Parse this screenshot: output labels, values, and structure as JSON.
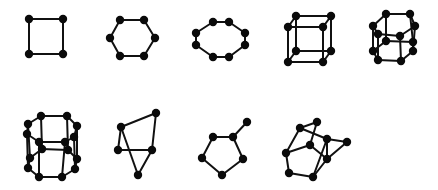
{
  "figure": {
    "width": 438,
    "height": 190,
    "background": "#ffffff",
    "ink_color": "#0a0a0a",
    "node_radius": 4.2,
    "edge_width": 2
  },
  "graphs": [
    {
      "id": "square",
      "nodes": [
        [
          29,
          19
        ],
        [
          63,
          19
        ],
        [
          63,
          54
        ],
        [
          29,
          54
        ]
      ],
      "edges": [
        [
          0,
          1
        ],
        [
          1,
          2
        ],
        [
          2,
          3
        ],
        [
          3,
          0
        ]
      ]
    },
    {
      "id": "hexagon",
      "nodes": [
        [
          120,
          20
        ],
        [
          144,
          20
        ],
        [
          155,
          38
        ],
        [
          144,
          56
        ],
        [
          120,
          56
        ],
        [
          110,
          38
        ]
      ],
      "edges": [
        [
          0,
          1
        ],
        [
          1,
          2
        ],
        [
          2,
          3
        ],
        [
          3,
          4
        ],
        [
          4,
          5
        ],
        [
          5,
          0
        ]
      ]
    },
    {
      "id": "octagon",
      "nodes": [
        [
          213,
          22
        ],
        [
          229,
          22
        ],
        [
          245,
          33
        ],
        [
          245,
          45
        ],
        [
          229,
          57
        ],
        [
          213,
          57
        ],
        [
          196,
          45
        ],
        [
          196,
          33
        ]
      ],
      "edges": [
        [
          0,
          1
        ],
        [
          1,
          2
        ],
        [
          2,
          3
        ],
        [
          3,
          4
        ],
        [
          4,
          5
        ],
        [
          5,
          6
        ],
        [
          6,
          7
        ],
        [
          7,
          0
        ]
      ]
    },
    {
      "id": "cube",
      "nodes": [
        [
          296,
          16
        ],
        [
          331,
          16
        ],
        [
          331,
          51
        ],
        [
          296,
          51
        ],
        [
          288,
          27
        ],
        [
          323,
          27
        ],
        [
          323,
          62
        ],
        [
          288,
          62
        ]
      ],
      "edges": [
        [
          0,
          1
        ],
        [
          1,
          2
        ],
        [
          2,
          3
        ],
        [
          3,
          0
        ],
        [
          4,
          5
        ],
        [
          5,
          6
        ],
        [
          6,
          7
        ],
        [
          7,
          4
        ],
        [
          0,
          4
        ],
        [
          1,
          5
        ],
        [
          2,
          6
        ],
        [
          3,
          7
        ]
      ]
    },
    {
      "id": "hexagonal-prism",
      "nodes": [
        [
          386,
          14
        ],
        [
          410,
          14
        ],
        [
          415,
          26
        ],
        [
          373,
          26
        ],
        [
          378,
          34
        ],
        [
          400,
          36
        ],
        [
          386,
          41
        ],
        [
          413,
          42
        ],
        [
          373,
          51
        ],
        [
          413,
          51
        ],
        [
          378,
          60
        ],
        [
          401,
          61
        ]
      ],
      "edges": [
        [
          0,
          1
        ],
        [
          1,
          2
        ],
        [
          2,
          5
        ],
        [
          5,
          4
        ],
        [
          4,
          3
        ],
        [
          3,
          0
        ],
        [
          6,
          7
        ],
        [
          7,
          9
        ],
        [
          9,
          11
        ],
        [
          11,
          10
        ],
        [
          10,
          8
        ],
        [
          8,
          6
        ],
        [
          0,
          6
        ],
        [
          1,
          7
        ],
        [
          3,
          8
        ],
        [
          4,
          10
        ],
        [
          5,
          11
        ],
        [
          2,
          9
        ]
      ]
    },
    {
      "id": "double-octagon-prism",
      "nodes": [
        [
          41,
          116
        ],
        [
          67,
          116
        ],
        [
          77,
          126
        ],
        [
          74,
          137
        ],
        [
          65,
          142
        ],
        [
          39,
          142
        ],
        [
          27,
          134
        ],
        [
          28,
          124
        ],
        [
          42,
          149
        ],
        [
          68,
          150
        ],
        [
          77,
          159
        ],
        [
          75,
          169
        ],
        [
          62,
          177
        ],
        [
          39,
          177
        ],
        [
          28,
          168
        ],
        [
          30,
          158
        ]
      ],
      "edges": [
        [
          0,
          1
        ],
        [
          1,
          2
        ],
        [
          2,
          3
        ],
        [
          3,
          4
        ],
        [
          4,
          5
        ],
        [
          5,
          6
        ],
        [
          6,
          7
        ],
        [
          7,
          0
        ],
        [
          8,
          9
        ],
        [
          9,
          10
        ],
        [
          10,
          11
        ],
        [
          11,
          12
        ],
        [
          12,
          13
        ],
        [
          13,
          14
        ],
        [
          14,
          15
        ],
        [
          15,
          8
        ],
        [
          0,
          8
        ],
        [
          1,
          9
        ],
        [
          2,
          10
        ],
        [
          3,
          11
        ],
        [
          5,
          13
        ],
        [
          6,
          14
        ],
        [
          7,
          15
        ],
        [
          4,
          12
        ]
      ]
    },
    {
      "id": "kite-graph",
      "nodes": [
        [
          121,
          127
        ],
        [
          156,
          113
        ],
        [
          152,
          150
        ],
        [
          118,
          150
        ],
        [
          138,
          175
        ]
      ],
      "edges": [
        [
          0,
          1
        ],
        [
          1,
          2
        ],
        [
          0,
          3
        ],
        [
          3,
          2
        ],
        [
          0,
          4
        ],
        [
          2,
          4
        ]
      ]
    },
    {
      "id": "pentagon-with-tail",
      "nodes": [
        [
          213,
          137
        ],
        [
          233,
          137
        ],
        [
          243,
          159
        ],
        [
          222,
          175
        ],
        [
          202,
          158
        ],
        [
          247,
          122
        ]
      ],
      "edges": [
        [
          0,
          1
        ],
        [
          1,
          2
        ],
        [
          2,
          3
        ],
        [
          3,
          4
        ],
        [
          4,
          0
        ],
        [
          1,
          5
        ]
      ]
    },
    {
      "id": "irregular-polyhedron",
      "nodes": [
        [
          317,
          122
        ],
        [
          300,
          128
        ],
        [
          327,
          139
        ],
        [
          347,
          142
        ],
        [
          310,
          145
        ],
        [
          286,
          153
        ],
        [
          327,
          159
        ],
        [
          289,
          173
        ],
        [
          313,
          177
        ]
      ],
      "edges": [
        [
          1,
          0
        ],
        [
          1,
          2
        ],
        [
          0,
          4
        ],
        [
          1,
          5
        ],
        [
          5,
          4
        ],
        [
          4,
          6
        ],
        [
          2,
          3
        ],
        [
          3,
          6
        ],
        [
          2,
          6
        ],
        [
          5,
          7
        ],
        [
          7,
          8
        ],
        [
          8,
          6
        ],
        [
          8,
          2
        ]
      ]
    }
  ]
}
